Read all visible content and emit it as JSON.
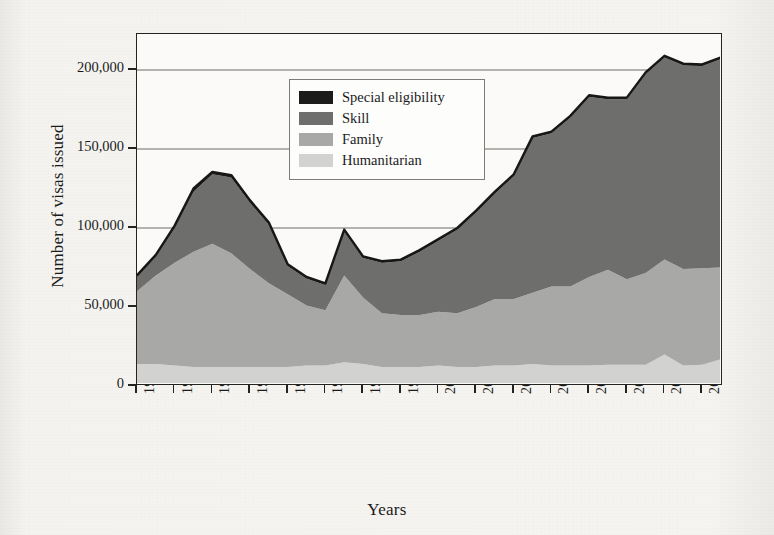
{
  "chart_data": {
    "type": "area",
    "stacked": true,
    "title": "",
    "xlabel": "Years",
    "ylabel": "Number of visas issued",
    "ylim": [
      0,
      220000
    ],
    "yticks": [
      0,
      50000,
      100000,
      150000,
      200000
    ],
    "ytick_labels": [
      "0",
      "50,000",
      "100,000",
      "150,000",
      "200,000"
    ],
    "grid": "horizontal gridlines at 100,000 / 150,000 / 200,000",
    "legend_position": "top-left inside plot",
    "categories": [
      "1984-85",
      "1985-86",
      "1986-87",
      "1987-88",
      "1988-89",
      "1989-90",
      "1990-91",
      "1991-92",
      "1992-93",
      "1993-94",
      "1994-95",
      "1995-96",
      "1996-97",
      "1997-98",
      "1998-99",
      "1999-00",
      "2000-01",
      "2001-02",
      "2002-03",
      "2003-04",
      "2004-05",
      "2005-06",
      "2006-07",
      "2007-08",
      "2008-09",
      "2009-10",
      "2010-11",
      "2011-12",
      "2012-13",
      "2013-14",
      "2014-15",
      "2015-16"
    ],
    "xtick_labels": [
      "1984-85",
      "1986-87",
      "1988-89",
      "1990-91",
      "1992-93",
      "1994-95",
      "1996-97",
      "1998-99",
      "2000-01",
      "2002-03",
      "2004-05",
      "2006-07",
      "2008-09",
      "2010-11",
      "2012-13",
      "2014-15"
    ],
    "series": [
      {
        "name": "Humanitarian",
        "color": "#d2d2d0",
        "values": [
          14000,
          14000,
          13000,
          12000,
          12000,
          12000,
          12000,
          12000,
          12000,
          13000,
          13000,
          15000,
          14000,
          12000,
          12000,
          12000,
          13000,
          12000,
          12000,
          13000,
          13000,
          14000,
          13000,
          13000,
          13000,
          13500,
          13500,
          13500,
          20000,
          13000,
          13500,
          17000
        ]
      },
      {
        "name": "Family",
        "color": "#a8a8a6",
        "values": [
          46000,
          56000,
          65000,
          73000,
          78000,
          72000,
          62000,
          53000,
          46000,
          38000,
          35000,
          55000,
          42000,
          34000,
          33000,
          33000,
          34000,
          34000,
          38000,
          42000,
          42000,
          45000,
          50000,
          50000,
          56000,
          60000,
          54000,
          58000,
          60000,
          61000,
          61000,
          58000
        ]
      },
      {
        "name": "Skill",
        "color": "#6e6e6c",
        "values": [
          9000,
          12000,
          22000,
          38000,
          44000,
          48000,
          42000,
          37000,
          18000,
          17000,
          16000,
          28000,
          25000,
          32000,
          34000,
          40000,
          45000,
          53000,
          60000,
          67000,
          78000,
          98000,
          97000,
          107000,
          114000,
          108000,
          114000,
          126000,
          128000,
          129000,
          128000,
          132000
        ]
      },
      {
        "name": "Special eligibility",
        "color": "#1c1c1a",
        "values": [
          1000,
          1000,
          1500,
          2000,
          1500,
          1500,
          1500,
          1500,
          1000,
          1000,
          1000,
          1000,
          1000,
          1000,
          1000,
          1000,
          1000,
          1000,
          1000,
          1000,
          1000,
          1000,
          1000,
          1000,
          1000,
          1000,
          1000,
          1000,
          1000,
          1000,
          1000,
          1000
        ]
      }
    ],
    "totals": [
      70000,
      83000,
      101500,
      125000,
      135500,
      133500,
      117500,
      103500,
      77000,
      69000,
      65000,
      99000,
      82000,
      79000,
      80000,
      86000,
      93000,
      100000,
      111000,
      123000,
      134000,
      158000,
      161000,
      171000,
      184000,
      182500,
      182500,
      198500,
      209000,
      204000,
      203500,
      208000
    ]
  },
  "legend": {
    "items": [
      {
        "label": "Special eligibility",
        "color": "#1c1c1a"
      },
      {
        "label": "Skill",
        "color": "#6e6e6c"
      },
      {
        "label": "Family",
        "color": "#a8a8a6"
      },
      {
        "label": "Humanitarian",
        "color": "#d2d2d0"
      }
    ]
  },
  "axes": {
    "y_title": "Number of visas issued",
    "x_title": "Years"
  }
}
